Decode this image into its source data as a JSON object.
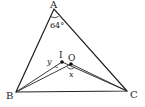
{
  "diagram": {
    "type": "triangle-geometry",
    "points": {
      "A": {
        "label": "A",
        "x": 54,
        "y": 9
      },
      "B": {
        "label": "B",
        "x": 16,
        "y": 92
      },
      "C": {
        "label": "C",
        "x": 127,
        "y": 91
      },
      "I": {
        "label": "I",
        "x": 62,
        "y": 62
      },
      "O": {
        "label": "O",
        "x": 71,
        "y": 64
      }
    },
    "angle_A_label": "64°",
    "angle_x_label": "x",
    "angle_y_label": "y",
    "colors": {
      "stroke": "#222222",
      "background": "#ffffff"
    }
  }
}
